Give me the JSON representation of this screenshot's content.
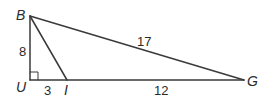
{
  "diagram": {
    "type": "geometry-right-triangle",
    "colors": {
      "stroke": "#3a3a3a",
      "text": "#2b2b2b",
      "background": "#ffffff"
    },
    "vertices": [
      {
        "id": "B",
        "label": "B",
        "x": 30,
        "y": 16
      },
      {
        "id": "U",
        "label": "U",
        "x": 30,
        "y": 80
      },
      {
        "id": "I",
        "label": "I",
        "x": 67,
        "y": 80
      },
      {
        "id": "G",
        "label": "G",
        "x": 244,
        "y": 80
      }
    ],
    "segments": [
      {
        "from": "B",
        "to": "U",
        "length_label": "8"
      },
      {
        "from": "U",
        "to": "I",
        "length_label": "3"
      },
      {
        "from": "I",
        "to": "G",
        "length_label": "12"
      },
      {
        "from": "B",
        "to": "G",
        "length_label": "17"
      },
      {
        "from": "B",
        "to": "I",
        "length_label": ""
      }
    ],
    "right_angle_at": "U",
    "labels": {
      "B": "B",
      "U": "U",
      "I": "I",
      "G": "G",
      "BU": "8",
      "UI": "3",
      "IG": "12",
      "BG": "17"
    }
  }
}
